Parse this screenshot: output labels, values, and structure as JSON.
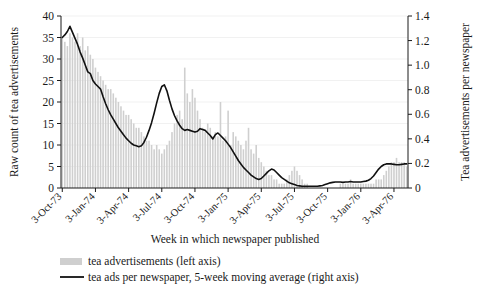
{
  "chart_data": {
    "type": "bar",
    "title": "",
    "xlabel": "Week in which newspaper published",
    "ylabel": "Raw count of tea advertisements",
    "y2label": "Tea advertisements per newspaper",
    "ylim": [
      0,
      40
    ],
    "y2lim": [
      0,
      1.4
    ],
    "yticks": [
      "0",
      "5",
      "10",
      "15",
      "20",
      "25",
      "30",
      "35",
      "40"
    ],
    "ytick_values": [
      0,
      5,
      10,
      15,
      20,
      25,
      30,
      35,
      40
    ],
    "y2ticks": [
      "0",
      "0.2",
      "0.4",
      "0.6",
      "0.8",
      "1.0",
      "1.2",
      "1.4"
    ],
    "y2tick_values": [
      0,
      0.2,
      0.4,
      0.6,
      0.8,
      1.0,
      1.2,
      1.4
    ],
    "grid": true,
    "grid_axis": "y",
    "legend_position": "below",
    "xtick_labels": [
      "3-Oct-73",
      "3-Jan-74",
      "3-Apr-74",
      "3-Jul-74",
      "3-Oct-74",
      "3-Jan-75",
      "3-Apr-75",
      "3-Jul-75",
      "3-Oct-75",
      "3-Jan-76",
      "3-Apr-76"
    ],
    "xtick_indices": [
      0,
      13,
      26,
      39,
      52,
      65,
      78,
      91,
      104,
      117,
      130
    ],
    "series": [
      {
        "name": "tea advertisements (left axis)",
        "type": "bar",
        "axis": "left",
        "color": "#cfcfcf",
        "values": [
          35,
          34,
          33,
          36,
          35,
          34,
          36,
          33,
          35,
          32,
          33,
          31,
          30,
          28,
          27,
          26,
          25,
          24,
          23,
          23,
          22,
          21,
          20,
          19,
          18,
          17,
          17,
          16,
          15,
          14,
          14,
          13,
          12,
          11,
          11,
          10,
          9,
          10,
          9,
          8,
          9,
          10,
          11,
          13,
          15,
          17,
          18,
          16,
          28,
          22,
          20,
          23,
          21,
          18,
          16,
          14,
          13,
          15,
          14,
          12,
          13,
          12,
          20,
          11,
          12,
          18,
          10,
          13,
          12,
          11,
          10,
          9,
          11,
          14,
          9,
          8,
          10,
          7,
          6,
          5,
          4,
          3,
          3,
          2,
          2,
          1,
          1,
          1,
          2,
          3,
          4,
          5,
          4,
          3,
          2,
          1,
          1,
          0,
          0,
          0,
          0,
          0,
          0,
          0,
          0,
          0,
          0,
          0,
          0,
          1,
          1,
          1,
          1,
          2,
          1,
          1,
          1,
          1,
          1,
          1,
          1,
          1,
          1,
          2,
          2,
          2,
          3,
          4,
          5,
          6,
          6,
          7,
          6,
          6,
          6,
          5
        ]
      },
      {
        "name": "tea ads per newspaper, 5-week moving average (right axis)",
        "type": "line",
        "axis": "right",
        "color": "#111111",
        "values_left_scale": [
          35.0,
          35.6,
          36.4,
          37.6,
          36.2,
          34.8,
          33.4,
          31.6,
          30.2,
          28.6,
          27.0,
          26.6,
          25.0,
          24.2,
          23.6,
          23.0,
          21.2,
          19.6,
          18.2,
          17.0,
          16.0,
          15.0,
          14.0,
          13.2,
          12.4,
          11.6,
          11.0,
          10.4,
          10.0,
          9.8,
          9.6,
          9.8,
          10.6,
          11.8,
          13.4,
          15.2,
          17.4,
          19.8,
          22.0,
          23.6,
          24.0,
          22.6,
          20.4,
          18.4,
          16.8,
          15.6,
          14.6,
          13.8,
          13.4,
          13.6,
          13.4,
          13.2,
          13.0,
          13.2,
          13.8,
          13.6,
          13.4,
          12.8,
          12.2,
          11.4,
          12.4,
          12.8,
          12.2,
          11.6,
          11.0,
          10.2,
          9.4,
          8.4,
          7.4,
          6.4,
          5.6,
          4.8,
          4.2,
          3.6,
          3.0,
          2.6,
          2.2,
          2.0,
          2.2,
          2.8,
          3.4,
          4.0,
          4.4,
          4.2,
          3.6,
          3.0,
          2.4,
          2.0,
          1.6,
          1.2,
          1.0,
          0.8,
          0.6,
          0.5,
          0.4,
          0.4,
          0.4,
          0.4,
          0.4,
          0.4,
          0.4,
          0.5,
          0.6,
          0.8,
          1.0,
          1.2,
          1.3,
          1.4,
          1.4,
          1.4,
          1.3,
          1.4,
          1.4,
          1.5,
          1.4,
          1.4,
          1.4,
          1.4,
          1.5,
          1.6,
          1.8,
          2.2,
          2.8,
          3.6,
          4.4,
          5.0,
          5.4,
          5.6,
          5.6,
          5.6,
          5.5,
          5.4,
          5.4,
          5.5,
          5.6,
          5.6
        ]
      }
    ]
  },
  "legend": {
    "items": [
      {
        "label": "tea advertisements (left axis)",
        "marker": "bar-swatch",
        "color": "#cfcfcf"
      },
      {
        "label": "tea ads per newspaper, 5-week moving average (right axis)",
        "marker": "line-swatch",
        "color": "#111111"
      }
    ]
  }
}
